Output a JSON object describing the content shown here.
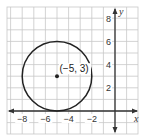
{
  "chart_data": {
    "type": "scatter",
    "title": "",
    "xlabel": "x",
    "ylabel": "y",
    "xlim": [
      -9.3,
      2
    ],
    "ylim": [
      -2,
      9.3
    ],
    "grid": true,
    "x_ticks": [
      -8,
      -6,
      -4,
      -2
    ],
    "y_ticks": [
      2,
      4,
      6,
      8
    ],
    "x_tick_labels": [
      "−8",
      "−6",
      "−4",
      "−2"
    ],
    "y_tick_labels": [
      "2",
      "4",
      "6",
      "8"
    ],
    "shapes": [
      {
        "type": "circle",
        "center": [
          -5,
          3
        ],
        "radius": 3
      }
    ],
    "points": [
      {
        "x": -5,
        "y": 3,
        "label": "(−5, 3)"
      }
    ]
  },
  "colors": {
    "grid": "#c8c8c8",
    "axis": "#333333",
    "circle": "#222222",
    "background": "#ffffff"
  }
}
